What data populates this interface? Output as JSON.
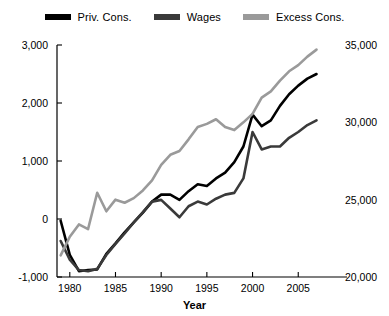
{
  "chart_data": {
    "type": "line",
    "title": "",
    "xlabel": "Year",
    "ylabel": "",
    "xlim": [
      1978.6,
      2007.6
    ],
    "xticks": [
      "1980",
      "1985",
      "1990",
      "1995",
      "2000",
      "2005"
    ],
    "xtick_values": [
      1980,
      1985,
      1990,
      1995,
      2000,
      2005
    ],
    "left_axis": {
      "ticks": [
        "3,000",
        "2,000",
        "1,000",
        "0",
        "-1,000"
      ],
      "tick_values": [
        3000,
        2000,
        1000,
        0,
        -1000
      ],
      "ylim": [
        -1000,
        3000
      ]
    },
    "right_axis": {
      "ticks": [
        "35,000",
        "30,000",
        "25,000",
        "20,000"
      ],
      "tick_values": [
        35000,
        30000,
        25000,
        20000
      ],
      "ylim": [
        20000,
        35000
      ]
    },
    "grid": false,
    "legend_position": "top-center",
    "x": [
      1979,
      1980,
      1981,
      1982,
      1983,
      1984,
      1985,
      1986,
      1987,
      1988,
      1989,
      1990,
      1991,
      1992,
      1993,
      1994,
      1995,
      1996,
      1997,
      1998,
      1999,
      2000,
      2001,
      2002,
      2003,
      2004,
      2005,
      2006,
      2007
    ],
    "series": [
      {
        "name": "Priv. Cons.",
        "color": "#000000",
        "axis": "left",
        "values": [
          -30,
          -620,
          -900,
          -880,
          -870,
          -600,
          -420,
          -230,
          -60,
          110,
          300,
          420,
          420,
          330,
          480,
          600,
          570,
          700,
          800,
          980,
          1250,
          1800,
          1600,
          1700,
          1950,
          2150,
          2300,
          2420,
          2500
        ]
      },
      {
        "name": "Wages",
        "color": "#3a3a3a",
        "axis": "left",
        "values": [
          -380,
          -700,
          -880,
          -900,
          -860,
          -620,
          -430,
          -250,
          -60,
          120,
          300,
          330,
          180,
          30,
          220,
          300,
          250,
          350,
          420,
          450,
          700,
          1500,
          1200,
          1250,
          1250,
          1400,
          1500,
          1620,
          1700
        ]
      },
      {
        "name": "Excess Cons.",
        "color": "#9a9a9a",
        "axis": "right",
        "values": [
          21400,
          22600,
          23400,
          23100,
          25450,
          24250,
          25000,
          24800,
          25100,
          25600,
          26250,
          27250,
          27900,
          28150,
          28900,
          29700,
          29900,
          30200,
          29700,
          29500,
          30000,
          30550,
          31600,
          32000,
          32700,
          33300,
          33700,
          34250,
          34700
        ]
      }
    ]
  },
  "legend": {
    "items": [
      {
        "label": "Priv. Cons.",
        "color": "#000000"
      },
      {
        "label": "Wages",
        "color": "#3a3a3a"
      },
      {
        "label": "Excess Cons.",
        "color": "#9a9a9a"
      }
    ]
  }
}
